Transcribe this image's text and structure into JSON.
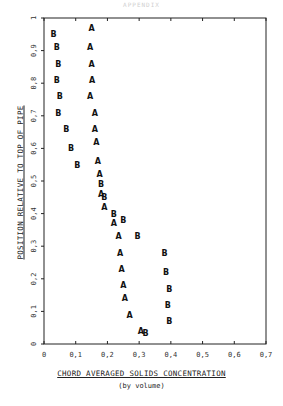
{
  "header": {
    "text": "APPENDIX"
  },
  "chart_data": {
    "type": "scatter",
    "title": "",
    "xlabel": "CHORD AVERAGED SOLIDS CONCENTRATION",
    "xlabel_sub": "(by volume)",
    "ylabel": "POSITION RELATIVE TO TOP OF PIPE",
    "xlim": [
      0,
      0.7
    ],
    "ylim": [
      0,
      1
    ],
    "xticks": [
      "0",
      "0,1",
      "0,2",
      "0,3",
      "0,4",
      "0,5",
      "0,6",
      "0,7"
    ],
    "yticks": [
      "0",
      "0,1",
      "0,2",
      "0,3",
      "0,4",
      "0,5",
      "0,6",
      "0,7",
      "0,8",
      "0,9",
      "1"
    ],
    "grid": false,
    "legend": "none (markers labelled A and B)",
    "series": [
      {
        "name": "A",
        "marker": "A",
        "points": [
          [
            0.15,
            0.97
          ],
          [
            0.145,
            0.91
          ],
          [
            0.15,
            0.86
          ],
          [
            0.152,
            0.81
          ],
          [
            0.145,
            0.76
          ],
          [
            0.16,
            0.71
          ],
          [
            0.16,
            0.66
          ],
          [
            0.165,
            0.62
          ],
          [
            0.17,
            0.56
          ],
          [
            0.175,
            0.52
          ],
          [
            0.18,
            0.46
          ],
          [
            0.19,
            0.42
          ],
          [
            0.22,
            0.37
          ],
          [
            0.235,
            0.33
          ],
          [
            0.24,
            0.28
          ],
          [
            0.245,
            0.23
          ],
          [
            0.25,
            0.18
          ],
          [
            0.255,
            0.14
          ],
          [
            0.27,
            0.09
          ],
          [
            0.305,
            0.04
          ]
        ]
      },
      {
        "name": "B",
        "marker": "B",
        "points": [
          [
            0.03,
            0.95
          ],
          [
            0.04,
            0.91
          ],
          [
            0.045,
            0.86
          ],
          [
            0.04,
            0.81
          ],
          [
            0.05,
            0.76
          ],
          [
            0.045,
            0.71
          ],
          [
            0.07,
            0.66
          ],
          [
            0.085,
            0.6
          ],
          [
            0.105,
            0.55
          ],
          [
            0.18,
            0.49
          ],
          [
            0.19,
            0.45
          ],
          [
            0.22,
            0.4
          ],
          [
            0.25,
            0.38
          ],
          [
            0.295,
            0.33
          ],
          [
            0.38,
            0.28
          ],
          [
            0.385,
            0.22
          ],
          [
            0.395,
            0.17
          ],
          [
            0.39,
            0.12
          ],
          [
            0.395,
            0.07
          ],
          [
            0.32,
            0.035
          ]
        ]
      }
    ]
  }
}
